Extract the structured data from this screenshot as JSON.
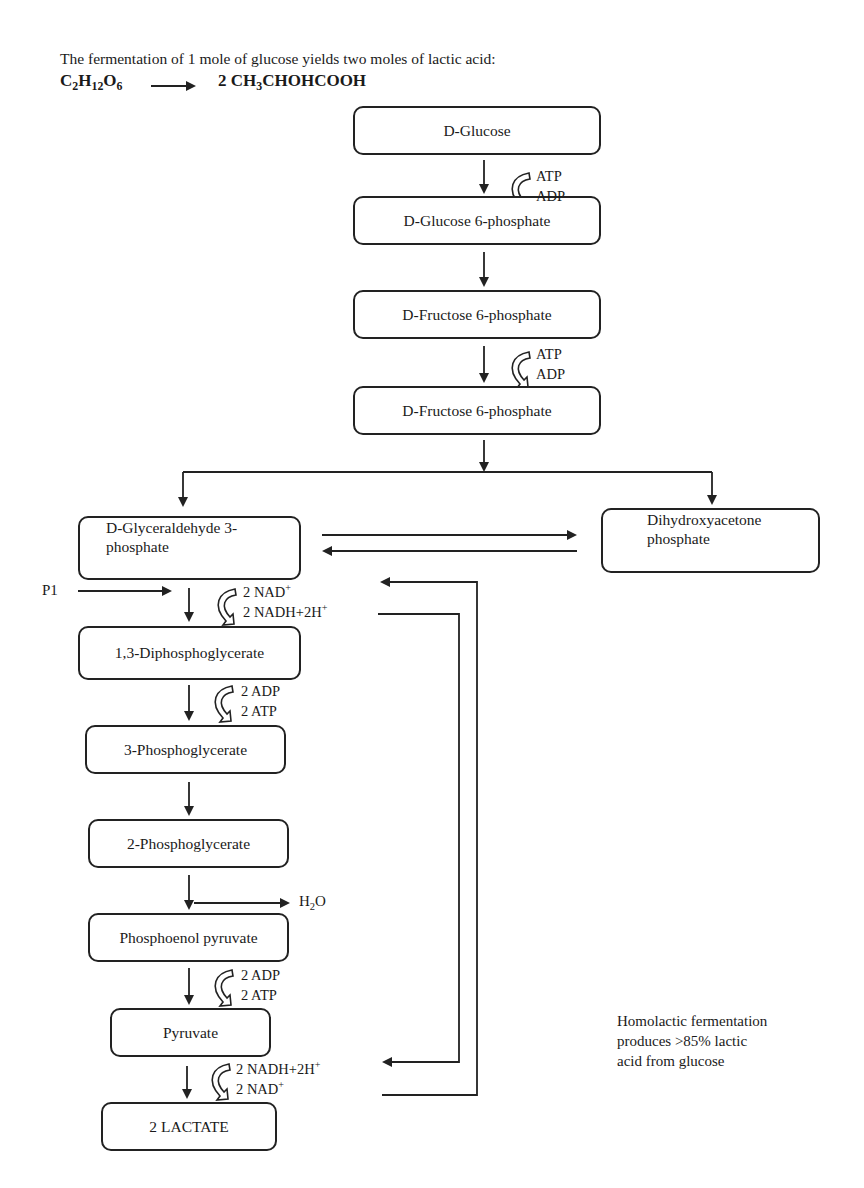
{
  "header": {
    "intro": "The fermentation of 1 mole of glucose yields two moles of lactic acid:",
    "reactant": {
      "parts": [
        "C",
        "2",
        "H",
        "12",
        "O",
        "6"
      ]
    },
    "product": {
      "prefix": "2 CH",
      "sub": "3",
      "suffix": "CHOHCOOH"
    }
  },
  "nodes": {
    "glucose": "D-Glucose",
    "glucose6p": "D-Glucose 6-phosphate",
    "fructose6p_1": "D-Fructose 6-phosphate",
    "fructose6p_2": "D-Fructose 6-phosphate",
    "gap_line1": "D-Glyceraldehyde 3-",
    "gap_line2": "phosphate",
    "dhap_line1": "Dihydroxyacetone",
    "dhap_line2": "phosphate",
    "dpg": "1,3-Diphosphoglycerate",
    "pg3": "3-Phosphoglycerate",
    "pg2": "2-Phosphoglycerate",
    "pep": "Phosphoenol pyruvate",
    "pyruvate": "Pyruvate",
    "lactate": "2 LACTATE"
  },
  "cofactors": {
    "step1": {
      "in": "ATP",
      "out": "ADP"
    },
    "step3": {
      "in": "ATP",
      "out": "ADP"
    },
    "gap_step": {
      "in": "2 NAD",
      "in_sup": "+",
      "out": "2 NADH+2H",
      "out_sup": "+"
    },
    "dpg_step": {
      "in": "2 ADP",
      "out": "2 ATP"
    },
    "pep_step": {
      "in": "2 ADP",
      "out": "2 ATP"
    },
    "pyr_step": {
      "in": "2 NADH+2H",
      "in_sup": "+",
      "out": "2 NAD",
      "out_sup": "+"
    },
    "pi_label": "P1",
    "water": {
      "base": "H",
      "sub": "2",
      "suffix": "O"
    }
  },
  "note": {
    "line1": "Homolactic fermentation",
    "line2": "produces >85% lactic",
    "line3": "acid from glucose"
  },
  "colors": {
    "stroke": "#222222",
    "background": "#ffffff"
  }
}
